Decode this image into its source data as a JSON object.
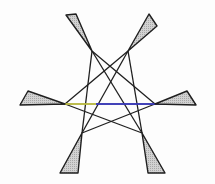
{
  "figure": {
    "colors": {
      "stroke": "#1f1f1f",
      "blade_fill": "#c9c9c9",
      "accent_yellow": "#e8e84a",
      "accent_blue": "#3b3bd9",
      "background": "#fdfdfd"
    },
    "blades": [
      {
        "id": "top-left",
        "points": "66,15 76,14 92,51"
      },
      {
        "id": "top-right",
        "points": "149,14 157,26 128,51"
      },
      {
        "id": "left",
        "points": "20,105 28,91 65,104"
      },
      {
        "id": "right",
        "points": "196,105 187,91 155,104"
      },
      {
        "id": "bottom-left",
        "points": "60,173 78,173 82,133"
      },
      {
        "id": "bottom-right",
        "points": "148,173 165,173 142,133"
      }
    ],
    "lines": [
      {
        "id": "l1",
        "x1": 92,
        "y1": 51,
        "x2": 82,
        "y2": 133
      },
      {
        "id": "l2",
        "x1": 128,
        "y1": 51,
        "x2": 142,
        "y2": 133
      },
      {
        "id": "l3",
        "x1": 92,
        "y1": 51,
        "x2": 155,
        "y2": 104
      },
      {
        "id": "l4",
        "x1": 128,
        "y1": 51,
        "x2": 65,
        "y2": 104
      },
      {
        "id": "l5",
        "x1": 65,
        "y1": 104,
        "x2": 142,
        "y2": 133
      },
      {
        "id": "l6",
        "x1": 155,
        "y1": 104,
        "x2": 82,
        "y2": 133
      },
      {
        "id": "l7",
        "x1": 128,
        "y1": 51,
        "x2": 82,
        "y2": 133
      },
      {
        "id": "l8",
        "x1": 92,
        "y1": 51,
        "x2": 142,
        "y2": 133
      }
    ],
    "baseline": {
      "y": 104,
      "x_start": 20,
      "x_end": 196,
      "yellow_segment": [
        65,
        96
      ],
      "blue_segment": [
        96,
        196
      ]
    }
  }
}
